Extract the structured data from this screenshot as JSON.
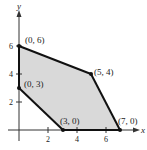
{
  "diagram": {
    "type": "feasible-region",
    "axes": {
      "x_label": "x",
      "y_label": "y",
      "x_ticks": [
        "2",
        "4",
        "6"
      ],
      "y_ticks": [
        "2",
        "4",
        "6"
      ]
    },
    "vertices": [
      {
        "label": "(0, 6)",
        "x": 0,
        "y": 6
      },
      {
        "label": "(5, 4)",
        "x": 5,
        "y": 4
      },
      {
        "label": "(7, 0)",
        "x": 7,
        "y": 0
      },
      {
        "label": "(3, 0)",
        "x": 3,
        "y": 0
      },
      {
        "label": "(0, 3)",
        "x": 0,
        "y": 3
      }
    ],
    "colors": {
      "region_fill": "#d9d9d9",
      "boundary": "#111111",
      "axis": "#333333"
    }
  }
}
